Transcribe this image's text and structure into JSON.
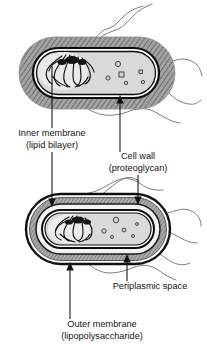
{
  "figure": {
    "width": 207,
    "height": 348,
    "background_color": "#ffffff"
  },
  "labels": [
    {
      "id": "inner-membrane",
      "line1": "Inner membrane",
      "line2": "(lipid bilayer)",
      "x": 52,
      "y1": 136,
      "y2": 148
    },
    {
      "id": "cell-wall",
      "line1": "Cell wall",
      "line2": "(proteoglycan)",
      "x": 138,
      "y1": 159,
      "y2": 171
    },
    {
      "id": "periplasmic-space",
      "line1": "Periplasmic space",
      "line2": "",
      "x": 150,
      "y1": 289,
      "y2": 289
    },
    {
      "id": "outer-membrane",
      "line1": "Outer membrane",
      "line2": "(lipopolysaccharide)",
      "x": 102,
      "y1": 327,
      "y2": 339
    }
  ],
  "cells": [
    {
      "id": "gram-positive-cell",
      "name": "top-cell",
      "description": "Gram-positive style cell with thick hatched cell wall",
      "center_x": 97,
      "center_y": 73,
      "half_width": 78,
      "half_height": 36
    },
    {
      "id": "gram-negative-cell",
      "name": "bottom-cell",
      "description": "Gram-negative style cell with outer membrane, periplasm and inner membrane",
      "center_x": 98,
      "center_y": 229,
      "half_width": 72,
      "half_height": 35
    }
  ],
  "colors": {
    "cell_wall_hatch": "#9a9a9a",
    "cytoplasm": "#d8d8d8",
    "membrane_dark": "#111111",
    "periplasm_light": "#efefef",
    "flagellum": "#6e6e6e",
    "text": "#151515",
    "background": "#ffffff"
  },
  "structures": {
    "nucleoid_label": "nucleoid-dna-tangle",
    "granule_label": "cytoplasmic-granule",
    "flagella_count_top": 5,
    "flagella_count_bottom": 6
  }
}
